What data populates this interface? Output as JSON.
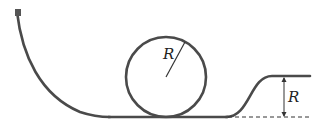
{
  "diagram": {
    "colors": {
      "track": "#4a4a4a",
      "block": "#555555",
      "line": "#333333",
      "background": "#ffffff"
    },
    "labels": {
      "loop_radius": "R",
      "exit_height": "R"
    },
    "elements": [
      {
        "name": "block",
        "description": "small block at top of curved ramp"
      },
      {
        "name": "ramp",
        "description": "curved descending ramp on left"
      },
      {
        "name": "loop",
        "description": "circular loop of radius R"
      },
      {
        "name": "exit-rise",
        "description": "track rises to a plateau of height R"
      },
      {
        "name": "height-dimension",
        "description": "double-headed arrow marking height R above dashed baseline"
      }
    ]
  }
}
